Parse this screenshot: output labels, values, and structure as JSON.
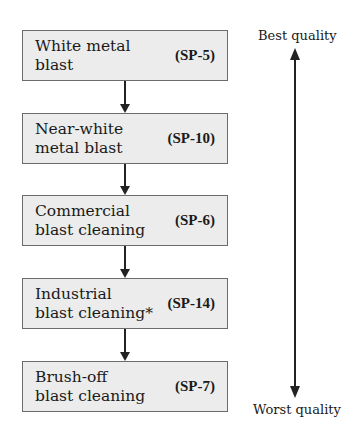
{
  "diagram": {
    "steps": [
      {
        "name": "White metal\nblast",
        "code": "(SP-5)"
      },
      {
        "name": "Near-white\nmetal blast",
        "code": "(SP-10)"
      },
      {
        "name": "Commercial\nblast cleaning",
        "code": "(SP-6)"
      },
      {
        "name": "Industrial\nblast cleaning*",
        "code": "(SP-14)"
      },
      {
        "name": "Brush-off\nblast cleaning",
        "code": "(SP-7)"
      }
    ],
    "scale": {
      "top_label": "Best quality",
      "bottom_label": "Worst quality"
    }
  }
}
